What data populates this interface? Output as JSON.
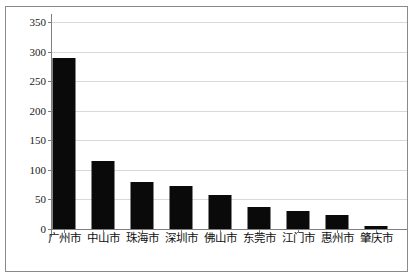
{
  "chart_data": {
    "type": "bar",
    "title": "",
    "xlabel": "",
    "ylabel": "",
    "categories": [
      "广州市",
      "中山市",
      "珠海市",
      "深圳市",
      "佛山市",
      "东莞市",
      "江门市",
      "惠州市",
      "肇庆市"
    ],
    "values": [
      290,
      115,
      80,
      73,
      58,
      37,
      30,
      23,
      5
    ],
    "ylim": [
      0,
      350
    ],
    "yticks": [
      0,
      50,
      100,
      150,
      200,
      250,
      300,
      350
    ],
    "ytick_labels": [
      "0",
      "50",
      "100",
      "150",
      "200",
      "250",
      "300",
      "350"
    ],
    "grid": true,
    "legend": false,
    "bar_color": "#0a0a0a",
    "gridline_color": "#d9d9d9",
    "axis_color": "#7f7f7f",
    "border_color": "#8a8a8a",
    "background": "#ffffff"
  }
}
